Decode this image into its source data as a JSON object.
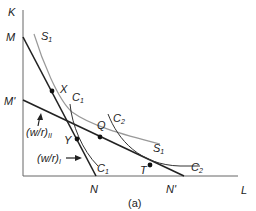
{
  "figure": {
    "caption": "(a)",
    "axes": {
      "y_label": "K",
      "x_label": "L"
    },
    "intercepts": {
      "M": "M",
      "M_prime": "M'",
      "N": "N",
      "N_prime": "N'"
    },
    "curves": {
      "S1": {
        "name": "S",
        "sub": "1"
      },
      "C1": {
        "name": "C",
        "sub": "1"
      },
      "C2": {
        "name": "C",
        "sub": "2"
      }
    },
    "points": [
      "X",
      "Y",
      "Q",
      "T"
    ],
    "wage_rental_labels": {
      "II": {
        "text": "(w/r)",
        "sub": "II"
      },
      "I": {
        "text": "(w/r)",
        "sub": "I"
      }
    }
  }
}
